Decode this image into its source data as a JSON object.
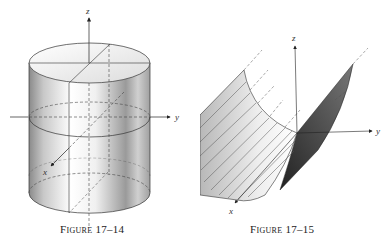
{
  "figures": [
    {
      "id": "17-14",
      "caption": "Figure 17–14",
      "description": "Circular cylinder about the z-axis",
      "axes": {
        "x": "x",
        "y": "y",
        "z": "z"
      }
    },
    {
      "id": "17-15",
      "caption": "Figure 17–15",
      "description": "Parabolic cylinder extending along the x-axis",
      "axes": {
        "x": "x",
        "y": "y",
        "z": "z"
      }
    }
  ],
  "colors": {
    "ink": "#222222",
    "shade_dark": "#555555",
    "background": "#ffffff"
  }
}
